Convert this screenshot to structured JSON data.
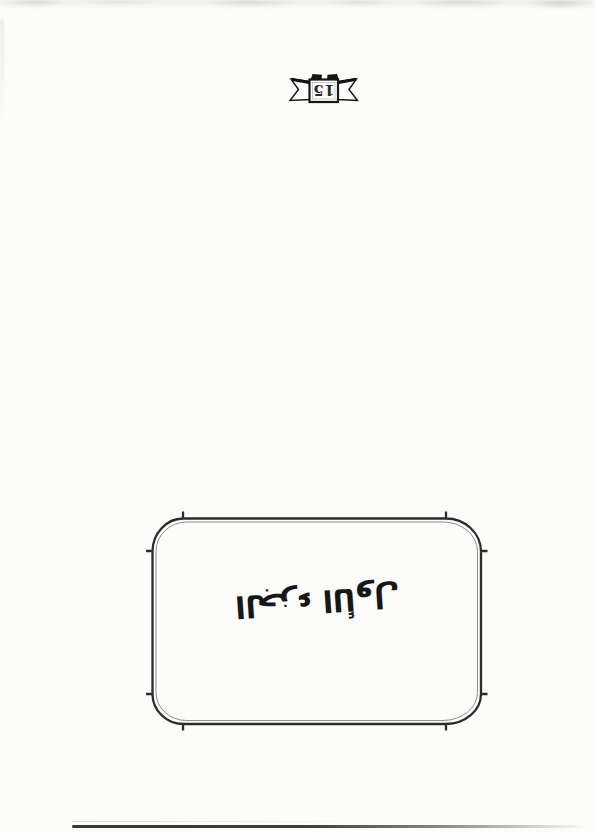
{
  "page_badge": {
    "number": "15"
  },
  "plaque": {
    "title_calligraphy": "الجزء الأول"
  },
  "colors": {
    "paper": "#fcfcfb",
    "ink": "#1d1d1d",
    "frame_outer": "#2c2c2c",
    "frame_inner": "#8d8d8d",
    "ribbon_outline": "#1b1b1b",
    "ribbon_tab_fill": "#141414",
    "scan_line": "#383838",
    "edge_noise": "#e3e3e1"
  }
}
